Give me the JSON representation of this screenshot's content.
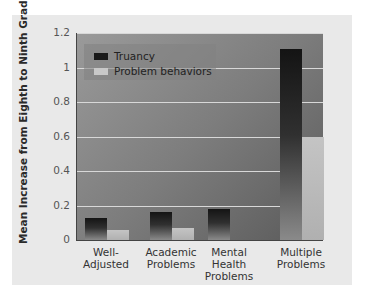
{
  "chart_data": {
    "type": "bar",
    "title": "",
    "xlabel": "",
    "ylabel": "Mean Increase from Eighth to Ninth Grade",
    "ylim": [
      0,
      1.2
    ],
    "yticks": [
      "0",
      "0.2",
      "0.4",
      "0.6",
      "0.8",
      "1",
      "1.2"
    ],
    "grid": true,
    "legend_position": "upper-left",
    "categories": [
      "Well-Adjusted",
      "Academic Problems",
      "Mental Health Problems",
      "Multiple Problems"
    ],
    "category_labels": [
      [
        "Well-",
        "Adjusted"
      ],
      [
        "Academic",
        "Problems"
      ],
      [
        "Mental",
        "Health",
        "Problems"
      ],
      [
        "Multiple",
        "Problems"
      ]
    ],
    "series": [
      {
        "name": "Truancy",
        "values": [
          0.13,
          0.16,
          0.18,
          1.11
        ],
        "color": "#1a1a1a"
      },
      {
        "name": "Problem behaviors",
        "values": [
          0.06,
          0.07,
          0.0,
          0.6
        ],
        "color": "#c8c8c8"
      }
    ]
  },
  "legend": {
    "truancy": "Truancy",
    "problem": "Problem behaviors"
  }
}
